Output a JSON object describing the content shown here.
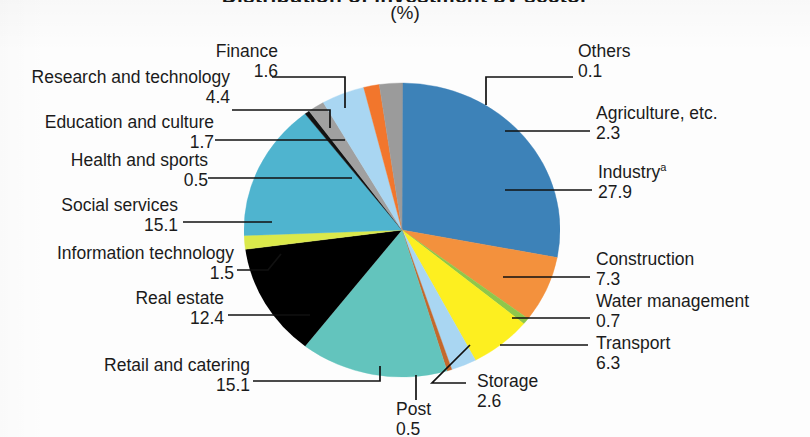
{
  "chart_data": {
    "type": "pie",
    "title": "Distribution of investment by sector",
    "unit_label": "(%)",
    "categories": [
      "Others",
      "Agriculture, etc.",
      "Industry",
      "Construction",
      "Water management",
      "Transport",
      "Storage",
      "Post",
      "Retail and catering",
      "Real estate",
      "Information technology",
      "Social services",
      "Health and sports",
      "Education and culture",
      "Research and technology",
      "Finance"
    ],
    "values": [
      0.1,
      2.3,
      27.9,
      7.3,
      0.7,
      6.3,
      2.6,
      0.5,
      15.1,
      12.4,
      1.5,
      15.1,
      0.5,
      1.7,
      4.4,
      1.6
    ],
    "colors": [
      "#9a9a9a",
      "#9a9a9a",
      "#3d82b8",
      "#f08a36",
      "#8dc63f",
      "#fff019",
      "#a8d4ef",
      "#c1622a",
      "#5fc3bd",
      "#fac council",
      "#d7e84a",
      "#4fb5cf",
      "#111111",
      "#9a9a9a",
      "#a9d6f0",
      "#f0732c"
    ],
    "start_angle_deg": 0,
    "legend": "callouts",
    "grid": false
  },
  "slices": [
    {
      "id": "others",
      "label": "Others",
      "value": "0.1",
      "pct": 0.1,
      "color": "#9b9b9b"
    },
    {
      "id": "industry",
      "label": "Industry",
      "value": "27.9",
      "pct": 27.9,
      "color": "#3d82b8",
      "superscript": "a"
    },
    {
      "id": "construction",
      "label": "Construction",
      "value": "7.3",
      "pct": 7.3,
      "color": "#f3913d"
    },
    {
      "id": "water-management",
      "label": "Water management",
      "value": "0.7",
      "pct": 0.7,
      "color": "#8fc74a"
    },
    {
      "id": "transport",
      "label": "Transport",
      "value": "6.3",
      "pct": 6.3,
      "color": "#fdef20"
    },
    {
      "id": "storage",
      "label": "Storage",
      "value": "2.6",
      "pct": 2.6,
      "color": "#a9d6f2"
    },
    {
      "id": "post",
      "label": "Post",
      "value": "0.5",
      "pct": 0.5,
      "color": "#c4682c"
    },
    {
      "id": "retail-and-catering",
      "label": "Retail and catering",
      "value": "15.1",
      "pct": 15.1,
      "color": "#63c4bd"
    },
    {
      "id": "real-estate",
      "label": "Real estate",
      "value": "12.4",
      "pct": 12.4,
      "color": "#f9c council"
    },
    {
      "id": "information-technology",
      "label": "Information technology",
      "value": "1.5",
      "pct": 1.5,
      "color": "#dbe94b"
    },
    {
      "id": "social-services",
      "label": "Social services",
      "value": "15.1",
      "pct": 15.1,
      "color": "#4fb4cf"
    },
    {
      "id": "health-and-sports",
      "label": "Health and sports",
      "value": "0.5",
      "pct": 0.5,
      "color": "#121212"
    },
    {
      "id": "education-and-culture",
      "label": "Education and culture",
      "value": "1.7",
      "pct": 1.7,
      "color": "#a0a0a0"
    },
    {
      "id": "research-and-technology",
      "label": "Research and technology",
      "value": "4.4",
      "pct": 4.4,
      "color": "#a9d6f2"
    },
    {
      "id": "finance",
      "label": "Finance",
      "value": "1.6",
      "pct": 1.6,
      "color": "#f2762c"
    },
    {
      "id": "agriculture",
      "label": "Agriculture, etc.",
      "value": "2.3",
      "pct": 2.3,
      "color": "#9b9b9b"
    }
  ]
}
